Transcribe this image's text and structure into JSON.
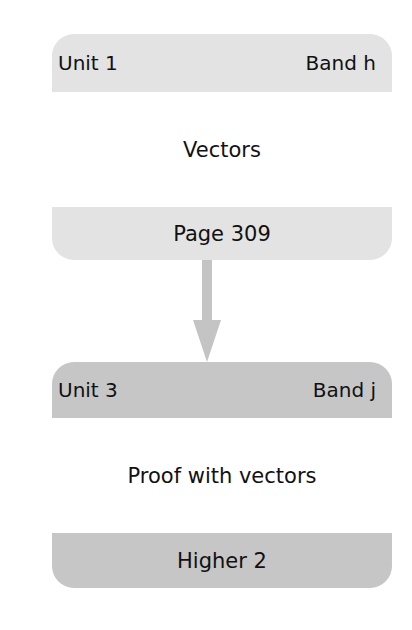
{
  "nodes": [
    {
      "unit": "Unit 1",
      "band": "Band h",
      "title": "Vectors",
      "footer": "Page 309"
    },
    {
      "unit": "Unit 3",
      "band": "Band j",
      "title": "Proof with vectors",
      "footer": "Higher 2"
    }
  ],
  "edges": [
    {
      "from": 0,
      "to": 1,
      "icon": "arrow-down-icon"
    }
  ],
  "colors": {
    "node1_band": "#e3e3e3",
    "node2_band": "#c6c6c6",
    "arrow": "#c4c4c4"
  }
}
